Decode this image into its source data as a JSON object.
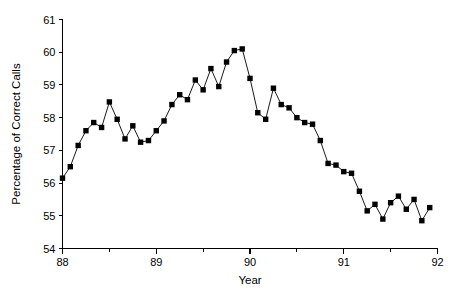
{
  "chart_data": {
    "type": "line",
    "title": "",
    "subtitle": "",
    "xlabel": "Year",
    "ylabel": "Percentage of Correct Calls",
    "xlim": [
      88,
      92
    ],
    "ylim": [
      54,
      61
    ],
    "xticks": [
      88,
      89,
      90,
      91,
      92
    ],
    "xtick_labels": [
      "88",
      "89",
      "90",
      "91",
      "92"
    ],
    "xminorticks": [
      88.5,
      89.5,
      90.5,
      91.5
    ],
    "yticks": [
      54,
      55,
      56,
      57,
      58,
      59,
      60,
      61
    ],
    "ytick_labels": [
      "54",
      "55",
      "56",
      "57",
      "58",
      "59",
      "60",
      "61"
    ],
    "grid": false,
    "legend": null,
    "marker": "filled-square",
    "marker_color": "#000000",
    "line_color": "#000000",
    "x": [
      88.0,
      88.083,
      88.167,
      88.25,
      88.333,
      88.417,
      88.5,
      88.583,
      88.667,
      88.75,
      88.833,
      88.917,
      89.0,
      89.083,
      89.167,
      89.25,
      89.333,
      89.417,
      89.5,
      89.583,
      89.667,
      89.75,
      89.833,
      89.917,
      90.0,
      90.083,
      90.167,
      90.25,
      90.333,
      90.417,
      90.5,
      90.583,
      90.667,
      90.75,
      90.833,
      90.917,
      91.0,
      91.083,
      91.167,
      91.25,
      91.333,
      91.417,
      91.5,
      91.583,
      91.667,
      91.75,
      91.833,
      91.917
    ],
    "values": [
      56.15,
      56.5,
      57.15,
      57.6,
      57.85,
      57.7,
      58.48,
      57.95,
      57.35,
      57.75,
      57.25,
      57.3,
      57.6,
      57.9,
      58.4,
      58.7,
      58.55,
      59.15,
      58.85,
      59.5,
      58.95,
      59.7,
      60.05,
      60.1,
      59.2,
      58.15,
      57.95,
      58.9,
      58.4,
      58.3,
      58.0,
      57.85,
      57.8,
      57.3,
      56.6,
      56.55,
      56.35,
      56.3,
      55.75,
      55.15,
      55.35,
      54.9,
      55.4,
      55.6,
      55.2,
      55.5,
      54.85,
      55.25
    ],
    "series": [
      {
        "name": "Percentage of Correct Calls",
        "values": [
          56.15,
          56.5,
          57.15,
          57.6,
          57.85,
          57.7,
          58.48,
          57.95,
          57.35,
          57.75,
          57.25,
          57.3,
          57.6,
          57.9,
          58.4,
          58.7,
          58.55,
          59.15,
          58.85,
          59.5,
          58.95,
          59.7,
          60.05,
          60.1,
          59.2,
          58.15,
          57.95,
          58.9,
          58.4,
          58.3,
          58.0,
          57.85,
          57.8,
          57.3,
          56.6,
          56.55,
          56.35,
          56.3,
          55.75,
          55.15,
          55.35,
          54.9,
          55.4,
          55.6,
          55.2,
          55.5,
          54.85,
          55.25
        ]
      }
    ]
  }
}
